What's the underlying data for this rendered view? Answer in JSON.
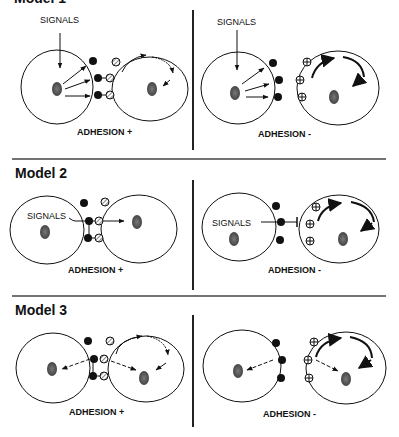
{
  "models": [
    {
      "title": "Model 1",
      "panels": [
        {
          "signals_label": "SIGNALS",
          "adhesion_label": "ADHESION +"
        },
        {
          "signals_label": "SIGNALS",
          "adhesion_label": "ADHESION -"
        }
      ]
    },
    {
      "title": "Model 2",
      "panels": [
        {
          "signals_label": "SIGNALS",
          "adhesion_label": "ADHESION +"
        },
        {
          "signals_label": "SIGNALS",
          "adhesion_label": "ADHESION -"
        }
      ]
    },
    {
      "title": "Model 3",
      "panels": [
        {
          "adhesion_label": "ADHESION +"
        },
        {
          "adhesion_label": "ADHESION -"
        }
      ]
    }
  ],
  "colors": {
    "line": "#111111",
    "nucleus": "#555555",
    "divider": "#333333"
  }
}
